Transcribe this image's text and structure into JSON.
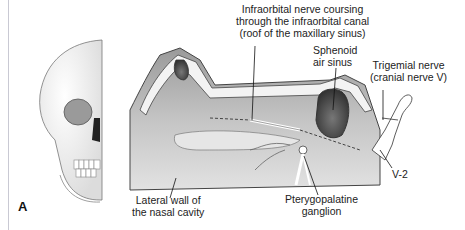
{
  "figure": {
    "panel_label": "A",
    "labels": {
      "infraorbital": "Infraorbital nerve coursing\nthrough the infraorbital canal\n(roof of the maxillary sinus)",
      "sphenoid": "Sphenoid\nair sinus",
      "trigemial": "Trigemial nerve\n(cranial nerve V)",
      "v2": "V-2",
      "lateral_wall": "Lateral wall of\nthe nasal cavity",
      "pterygopalatine": "Pterygopalatine\nganglion"
    },
    "colors": {
      "bone": "#f2f2f2",
      "cavity_dark": "#8a8a8a",
      "cavity_mid": "#bdbdbd",
      "outline": "#333333",
      "nerve": "#ffffff"
    }
  }
}
